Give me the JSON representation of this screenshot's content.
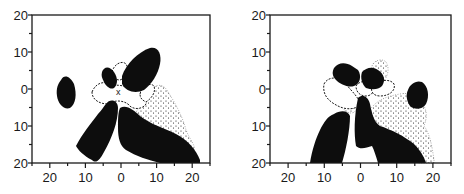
{
  "figure": {
    "panels": [
      {
        "id": "left",
        "x_tick_labels": [
          "20",
          "10",
          "0",
          "10",
          "20"
        ],
        "y_tick_labels": [
          "20",
          "10",
          "0",
          "10",
          "20"
        ]
      },
      {
        "id": "right",
        "x_tick_labels": [
          "20",
          "10",
          "0",
          "10",
          "20"
        ],
        "y_tick_labels": [
          "20",
          "10",
          "0",
          "10",
          "20"
        ]
      }
    ],
    "colors": {
      "ink": "#0d0d0d",
      "paper": "#ffffff"
    }
  },
  "chart_data": [
    {
      "type": "heatmap",
      "title": "",
      "xlabel": "",
      "ylabel": "",
      "x_ticks": [
        -20,
        -10,
        0,
        10,
        20
      ],
      "x_tick_labels": [
        "20",
        "10",
        "0",
        "10",
        "20"
      ],
      "y_ticks": [
        20,
        10,
        0,
        -10,
        -20
      ],
      "y_tick_labels": [
        "20",
        "10",
        "0",
        "10",
        "20"
      ],
      "xlim": [
        -25,
        25
      ],
      "ylim": [
        -20,
        20
      ],
      "grid": false,
      "legend": "none",
      "regions": [
        "solid black",
        "stippled",
        "dashed outline",
        "center marker x at (0,0)"
      ]
    },
    {
      "type": "heatmap",
      "title": "",
      "xlabel": "",
      "ylabel": "",
      "x_ticks": [
        -20,
        -10,
        0,
        10,
        20
      ],
      "x_tick_labels": [
        "20",
        "10",
        "0",
        "10",
        "20"
      ],
      "y_ticks": [
        20,
        10,
        0,
        -10,
        -20
      ],
      "y_tick_labels": [
        "20",
        "10",
        "0",
        "10",
        "20"
      ],
      "xlim": [
        -25,
        25
      ],
      "ylim": [
        -20,
        20
      ],
      "grid": false,
      "legend": "none",
      "regions": [
        "solid black",
        "stippled",
        "dashed outline"
      ]
    }
  ]
}
